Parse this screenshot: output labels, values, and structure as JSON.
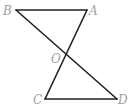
{
  "diagram": {
    "points": {
      "A": {
        "label": "A",
        "x": 87,
        "y": 10
      },
      "B": {
        "label": "B",
        "x": 16,
        "y": 10
      },
      "O": {
        "label": "O",
        "x": 67,
        "y": 57
      },
      "C": {
        "label": "C",
        "x": 45,
        "y": 99
      },
      "D": {
        "label": "D",
        "x": 117,
        "y": 99
      }
    },
    "segments": [
      [
        "B",
        "A"
      ],
      [
        "A",
        "C"
      ],
      [
        "B",
        "D"
      ],
      [
        "C",
        "D"
      ]
    ],
    "colors": {
      "line": "#222222",
      "label": "#a0a0a0",
      "background": "#ffffff"
    }
  }
}
